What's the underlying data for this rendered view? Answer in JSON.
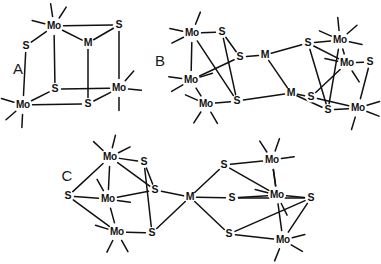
{
  "figure": {
    "background_color": "#ffffff",
    "line_color": "#111111",
    "width": 381,
    "height": 264
  },
  "panels": [
    {
      "id": "A",
      "label": "A",
      "label_x": 18,
      "label_y": 70,
      "description": "Cubane-type Mo3MS4 cluster",
      "atoms": [
        {
          "name": "Mo",
          "label": "Mo",
          "x": 54,
          "y": 26
        },
        {
          "name": "S",
          "label": "S",
          "x": 26,
          "y": 46
        },
        {
          "name": "M",
          "label": "M",
          "x": 88,
          "y": 43
        },
        {
          "name": "S",
          "label": "S",
          "x": 119,
          "y": 25
        },
        {
          "name": "S",
          "label": "S",
          "x": 55,
          "y": 89
        },
        {
          "name": "Mo",
          "label": "Mo",
          "x": 23,
          "y": 105
        },
        {
          "name": "S",
          "label": "S",
          "x": 88,
          "y": 104
        },
        {
          "name": "Mo",
          "label": "Mo",
          "x": 119,
          "y": 88
        }
      ],
      "bonds": [
        [
          0,
          1
        ],
        [
          0,
          3
        ],
        [
          0,
          4
        ],
        [
          1,
          5
        ],
        [
          3,
          7
        ],
        [
          2,
          3
        ],
        [
          2,
          6
        ],
        [
          5,
          4
        ],
        [
          5,
          6
        ],
        [
          4,
          7
        ],
        [
          6,
          7
        ],
        [
          0,
          2
        ]
      ],
      "stubs": [
        {
          "from": 0,
          "dx": -1.0,
          "dy": -0.25
        },
        {
          "from": 0,
          "dx": -0.15,
          "dy": -1.0
        },
        {
          "from": 0,
          "dx": 0.55,
          "dy": -0.85
        },
        {
          "from": 5,
          "dx": -1.0,
          "dy": -0.3
        },
        {
          "from": 5,
          "dx": -0.75,
          "dy": 0.65
        },
        {
          "from": 5,
          "dx": -0.05,
          "dy": 1.0
        },
        {
          "from": 7,
          "dx": 1.0,
          "dy": 0.1
        },
        {
          "from": 7,
          "dx": 0.65,
          "dy": -0.75
        },
        {
          "from": 7,
          "dx": 0.0,
          "dy": 1.0
        }
      ]
    },
    {
      "id": "B",
      "label": "B",
      "label_x": 160,
      "label_y": 62,
      "description": "Double Mo3S4 clusters bridged by two M centers",
      "atoms": [
        {
          "name": "Mo",
          "label": "Mo",
          "x": 192,
          "y": 33
        },
        {
          "name": "S",
          "label": "S",
          "x": 222,
          "y": 32
        },
        {
          "name": "S",
          "label": "S",
          "x": 240,
          "y": 57
        },
        {
          "name": "M",
          "label": "M",
          "x": 265,
          "y": 55
        },
        {
          "name": "Mo",
          "label": "Mo",
          "x": 191,
          "y": 80
        },
        {
          "name": "Mo",
          "label": "Mo",
          "x": 206,
          "y": 104
        },
        {
          "name": "S",
          "label": "S",
          "x": 237,
          "y": 101
        },
        {
          "name": "M",
          "label": "M",
          "x": 291,
          "y": 93
        },
        {
          "name": "S",
          "label": "S",
          "x": 311,
          "y": 97
        },
        {
          "name": "S",
          "label": "S",
          "x": 308,
          "y": 43
        },
        {
          "name": "Mo",
          "label": "Mo",
          "x": 340,
          "y": 40
        },
        {
          "name": "Mo",
          "label": "Mo",
          "x": 347,
          "y": 63
        },
        {
          "name": "S",
          "label": "S",
          "x": 370,
          "y": 62
        },
        {
          "name": "S",
          "label": "S",
          "x": 328,
          "y": 110
        },
        {
          "name": "Mo",
          "label": "Mo",
          "x": 358,
          "y": 108
        }
      ],
      "bonds": [
        [
          0,
          1
        ],
        [
          1,
          2
        ],
        [
          2,
          3
        ],
        [
          0,
          4
        ],
        [
          4,
          5
        ],
        [
          0,
          6
        ],
        [
          5,
          6
        ],
        [
          4,
          2
        ],
        [
          1,
          6
        ],
        [
          6,
          7
        ],
        [
          3,
          7
        ],
        [
          3,
          9
        ],
        [
          7,
          8
        ],
        [
          9,
          10
        ],
        [
          9,
          11
        ],
        [
          10,
          11
        ],
        [
          11,
          12
        ],
        [
          8,
          11
        ],
        [
          8,
          14
        ],
        [
          7,
          13
        ],
        [
          13,
          14
        ],
        [
          10,
          13
        ],
        [
          14,
          12
        ],
        [
          9,
          13
        ]
      ],
      "stubs": [
        {
          "from": 0,
          "dx": -1.0,
          "dy": -0.2
        },
        {
          "from": 0,
          "dx": -0.9,
          "dy": 0.45
        },
        {
          "from": 0,
          "dx": 0.4,
          "dy": -1.0
        },
        {
          "from": 4,
          "dx": -1.0,
          "dy": -0.15
        },
        {
          "from": 4,
          "dx": -0.85,
          "dy": 0.5
        },
        {
          "from": 4,
          "dx": 0.95,
          "dy": -0.3
        },
        {
          "from": 5,
          "dx": -0.9,
          "dy": -0.4
        },
        {
          "from": 5,
          "dx": -0.55,
          "dy": 0.85
        },
        {
          "from": 5,
          "dx": 0.5,
          "dy": 0.85
        },
        {
          "from": 10,
          "dx": -0.9,
          "dy": -0.4
        },
        {
          "from": 10,
          "dx": -0.1,
          "dy": -1.0
        },
        {
          "from": 10,
          "dx": 0.75,
          "dy": -0.65
        },
        {
          "from": 10,
          "dx": 1.0,
          "dy": 0.2
        },
        {
          "from": 11,
          "dx": -1.0,
          "dy": -0.2
        },
        {
          "from": 11,
          "dx": 0.55,
          "dy": 0.85
        },
        {
          "from": 14,
          "dx": 1.0,
          "dy": -0.3
        },
        {
          "from": 14,
          "dx": 0.9,
          "dy": 0.35
        },
        {
          "from": 14,
          "dx": -0.3,
          "dy": 1.0
        }
      ]
    },
    {
      "id": "C",
      "label": "C",
      "label_x": 67,
      "label_y": 177,
      "description": "Two Mo3S4 clusters bridged by a single central M center",
      "atoms": [
        {
          "name": "Mo",
          "label": "Mo",
          "x": 110,
          "y": 157
        },
        {
          "name": "S",
          "label": "S",
          "x": 144,
          "y": 162
        },
        {
          "name": "S",
          "label": "S",
          "x": 155,
          "y": 190
        },
        {
          "name": "S",
          "label": "S",
          "x": 68,
          "y": 196
        },
        {
          "name": "Mo",
          "label": "Mo",
          "x": 108,
          "y": 199
        },
        {
          "name": "Mo",
          "label": "Mo",
          "x": 117,
          "y": 232
        },
        {
          "name": "S",
          "label": "S",
          "x": 152,
          "y": 233
        },
        {
          "name": "M",
          "label": "M",
          "x": 190,
          "y": 197
        },
        {
          "name": "S",
          "label": "S",
          "x": 224,
          "y": 165
        },
        {
          "name": "S",
          "label": "S",
          "x": 232,
          "y": 198
        },
        {
          "name": "S",
          "label": "S",
          "x": 229,
          "y": 234
        },
        {
          "name": "Mo",
          "label": "Mo",
          "x": 272,
          "y": 160
        },
        {
          "name": "Mo",
          "label": "Mo",
          "x": 277,
          "y": 195
        },
        {
          "name": "S",
          "label": "S",
          "x": 311,
          "y": 198
        },
        {
          "name": "Mo",
          "label": "Mo",
          "x": 283,
          "y": 240
        }
      ],
      "bonds": [
        [
          0,
          1
        ],
        [
          1,
          2
        ],
        [
          0,
          3
        ],
        [
          0,
          4
        ],
        [
          3,
          4
        ],
        [
          4,
          5
        ],
        [
          3,
          5
        ],
        [
          4,
          2
        ],
        [
          5,
          6
        ],
        [
          1,
          6
        ],
        [
          2,
          7
        ],
        [
          6,
          7
        ],
        [
          7,
          8
        ],
        [
          7,
          9
        ],
        [
          7,
          10
        ],
        [
          8,
          11
        ],
        [
          8,
          12
        ],
        [
          9,
          12
        ],
        [
          11,
          12
        ],
        [
          12,
          13
        ],
        [
          9,
          13
        ],
        [
          10,
          13
        ],
        [
          10,
          14
        ],
        [
          13,
          14
        ],
        [
          11,
          14
        ],
        [
          0,
          2
        ]
      ],
      "stubs": [
        {
          "from": 0,
          "dx": -0.75,
          "dy": -0.7
        },
        {
          "from": 0,
          "dx": 0.25,
          "dy": -1.0
        },
        {
          "from": 0,
          "dx": 0.9,
          "dy": -0.45
        },
        {
          "from": 4,
          "dx": -0.5,
          "dy": -0.9
        },
        {
          "from": 4,
          "dx": 1.0,
          "dy": 0.15
        },
        {
          "from": 5,
          "dx": -0.95,
          "dy": -0.3
        },
        {
          "from": 5,
          "dx": -0.45,
          "dy": 0.9
        },
        {
          "from": 5,
          "dx": 0.5,
          "dy": 0.9
        },
        {
          "from": 11,
          "dx": -0.55,
          "dy": -0.85
        },
        {
          "from": 11,
          "dx": 0.35,
          "dy": -1.0
        },
        {
          "from": 11,
          "dx": 1.0,
          "dy": -0.15
        },
        {
          "from": 12,
          "dx": -1.0,
          "dy": -0.25
        },
        {
          "from": 12,
          "dx": 0.45,
          "dy": 0.9
        },
        {
          "from": 14,
          "dx": 1.0,
          "dy": -0.25
        },
        {
          "from": 14,
          "dx": 0.85,
          "dy": 0.5
        },
        {
          "from": 14,
          "dx": -0.4,
          "dy": 1.0
        }
      ]
    }
  ]
}
